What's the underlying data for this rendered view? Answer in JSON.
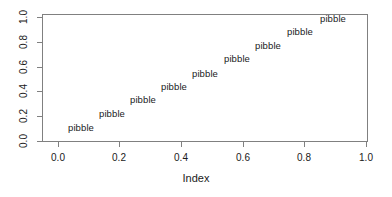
{
  "chart_data": {
    "type": "scatter",
    "title": "",
    "xlabel": "Index",
    "ylabel": "",
    "xlim": [
      -0.04,
      1.04
    ],
    "ylim": [
      -0.04,
      1.04
    ],
    "grid": false,
    "legend": null,
    "point_marker": "pibble",
    "point_style": "text-label",
    "xticks": [
      "0.0",
      "0.2",
      "0.4",
      "0.6",
      "0.8",
      "1.0"
    ],
    "xtick_values": [
      0.0,
      0.2,
      0.4,
      0.6,
      0.8,
      1.0
    ],
    "yticks": [
      "0.0",
      "0.2",
      "0.4",
      "0.6",
      "0.8",
      "1.0"
    ],
    "ytick_values": [
      0.0,
      0.2,
      0.4,
      0.6,
      0.8,
      1.0
    ],
    "x": [
      0.1,
      0.2,
      0.3,
      0.4,
      0.5,
      0.6,
      0.7,
      0.8,
      0.9
    ],
    "y": [
      0.1,
      0.2,
      0.3,
      0.4,
      0.5,
      0.6,
      0.7,
      0.8,
      0.9
    ],
    "labels": [
      "pibble",
      "pibble",
      "pibble",
      "pibble",
      "pibble",
      "pibble",
      "pibble",
      "pibble",
      "pibble"
    ],
    "points": [
      {
        "label": "pibble",
        "x": 0.1,
        "y": 0.1,
        "px": 81,
        "py": 128
      },
      {
        "label": "pibble",
        "x": 0.2,
        "y": 0.2,
        "px": 112,
        "py": 114
      },
      {
        "label": "pibble",
        "x": 0.3,
        "y": 0.3,
        "px": 143,
        "py": 100
      },
      {
        "label": "pibble",
        "x": 0.4,
        "y": 0.4,
        "px": 174,
        "py": 87
      },
      {
        "label": "pibble",
        "x": 0.5,
        "y": 0.5,
        "px": 205,
        "py": 74
      },
      {
        "label": "pibble",
        "x": 0.6,
        "y": 0.6,
        "px": 237,
        "py": 59
      },
      {
        "label": "pibble",
        "x": 0.7,
        "y": 0.7,
        "px": 268,
        "py": 46
      },
      {
        "label": "pibble",
        "x": 0.8,
        "y": 0.8,
        "px": 300,
        "py": 32
      },
      {
        "label": "pibble",
        "x": 0.9,
        "y": 0.9,
        "px": 333,
        "py": 19
      }
    ]
  },
  "axis": {
    "x_title": "Index",
    "x_tick_px": [
      58,
      119,
      181,
      243,
      304,
      366
    ],
    "y_tick_px": [
      141,
      116,
      91,
      67,
      42,
      17
    ]
  },
  "colors": {
    "axis": "#808080",
    "text": "#1a1a1a",
    "background": "#ffffff"
  }
}
